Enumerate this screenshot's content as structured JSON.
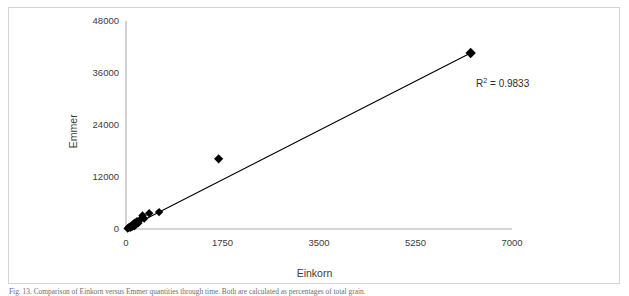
{
  "figure": {
    "caption": "Fig. 13. Comparison of Einkorn versus Emmer quantities through time. Both are calculated as percentages of total grain."
  },
  "chart_data": {
    "type": "scatter",
    "title": "",
    "xlabel": "Einkorn",
    "ylabel": "Emmer",
    "xlim": [
      0,
      7000
    ],
    "ylim": [
      0,
      48000
    ],
    "xticks": [
      0,
      1750,
      3500,
      5250,
      7000
    ],
    "xtick_labels": [
      "0",
      "1750",
      "3500",
      "5250",
      "7000"
    ],
    "yticks": [
      0,
      12000,
      24000,
      36000,
      48000
    ],
    "ytick_labels": [
      "0",
      "12000",
      "24000",
      "36000",
      "48000"
    ],
    "grid": false,
    "legend": null,
    "marker": "diamond",
    "marker_color": "#000000",
    "annotations": [
      {
        "name": "r-squared",
        "text": "R² = 0.9833",
        "value": 0.9833,
        "x": 5600,
        "y": 33500
      }
    ],
    "trendline": {
      "type": "linear",
      "r_squared": 0.9833,
      "x_start": 0,
      "y_start": 0,
      "x_end": 6250,
      "y_end": 40600
    },
    "series": [
      {
        "name": "Einkorn vs Emmer",
        "points": [
          {
            "x": 30,
            "y": 120
          },
          {
            "x": 45,
            "y": 300
          },
          {
            "x": 60,
            "y": 500
          },
          {
            "x": 75,
            "y": 260
          },
          {
            "x": 90,
            "y": 700
          },
          {
            "x": 105,
            "y": 430
          },
          {
            "x": 120,
            "y": 900
          },
          {
            "x": 135,
            "y": 1250
          },
          {
            "x": 150,
            "y": 640
          },
          {
            "x": 165,
            "y": 1500
          },
          {
            "x": 185,
            "y": 1100
          },
          {
            "x": 200,
            "y": 1800
          },
          {
            "x": 225,
            "y": 1400
          },
          {
            "x": 260,
            "y": 2200
          },
          {
            "x": 300,
            "y": 3100
          },
          {
            "x": 330,
            "y": 2400
          },
          {
            "x": 420,
            "y": 3650
          },
          {
            "x": 600,
            "y": 3900
          },
          {
            "x": 1680,
            "y": 16200
          },
          {
            "x": 6250,
            "y": 40600
          }
        ]
      }
    ]
  },
  "axis_titles": {
    "x": "Einkorn",
    "y": "Emmer"
  }
}
